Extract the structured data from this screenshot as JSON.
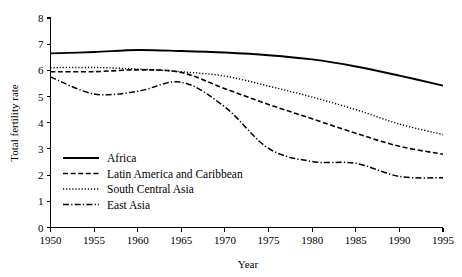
{
  "chart_data": {
    "type": "line",
    "title": "",
    "subtitle": "",
    "xlabel": "Year",
    "ylabel": "Total fertility rate",
    "x": [
      1950,
      1955,
      1960,
      1965,
      1970,
      1975,
      1980,
      1985,
      1990,
      1995
    ],
    "xtick_labels": [
      "1950",
      "1955",
      "1960",
      "1965",
      "1970",
      "1975",
      "1980",
      "1985",
      "1990",
      "1995"
    ],
    "ytick_labels": [
      "0",
      "1",
      "2",
      "3",
      "4",
      "5",
      "6",
      "7",
      "8"
    ],
    "xlim": [
      1950,
      1995
    ],
    "ylim": [
      0,
      8
    ],
    "ytick_step": 1,
    "grid": false,
    "legend_position": "lower-left-inside",
    "line_color": "#000000",
    "series": [
      {
        "name": "Africa",
        "dash": "solid",
        "width": 1.9,
        "values": [
          6.65,
          6.7,
          6.78,
          6.74,
          6.68,
          6.58,
          6.42,
          6.15,
          5.8,
          5.42
        ]
      },
      {
        "name": "Latin America and Caribbean",
        "dash": "dashed",
        "width": 1.6,
        "values": [
          5.95,
          5.95,
          6.02,
          5.92,
          5.3,
          4.7,
          4.15,
          3.6,
          3.1,
          2.8
        ]
      },
      {
        "name": "South Central Asia",
        "dash": "dotted",
        "width": 1.4,
        "values": [
          6.1,
          6.11,
          6.05,
          5.95,
          5.78,
          5.4,
          4.98,
          4.5,
          3.95,
          3.55
        ]
      },
      {
        "name": "East Asia",
        "dash": "dashdot",
        "width": 1.5,
        "values": [
          5.75,
          5.1,
          5.2,
          5.55,
          4.6,
          3.02,
          2.52,
          2.45,
          1.95,
          1.9
        ]
      }
    ]
  },
  "legend": {
    "entries": [
      {
        "label": "Africa"
      },
      {
        "label": "Latin America and Caribbean"
      },
      {
        "label": "South Central Asia"
      },
      {
        "label": "East Asia"
      }
    ]
  }
}
